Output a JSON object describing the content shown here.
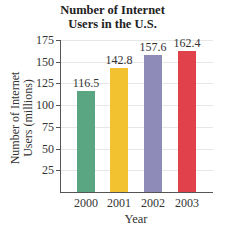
{
  "chart_data": {
    "type": "bar",
    "title": "Number of Internet Users in the U.S.",
    "title_lines": [
      "Number of Internet",
      "Users in the U.S."
    ],
    "categories": [
      "2000",
      "2001",
      "2002",
      "2003"
    ],
    "values": [
      116.5,
      142.8,
      157.6,
      162.4
    ],
    "value_labels": [
      "116.5",
      "142.8",
      "157.6",
      "162.4"
    ],
    "colors": [
      "#5aa683",
      "#f2c230",
      "#8f8bb8",
      "#e0414b"
    ],
    "xlabel": "Year",
    "ylabel": "Number of Internet Users (millions)",
    "ylabel_lines": [
      "Number of Internet",
      "Users (millions)"
    ],
    "yticks": [
      25,
      50,
      75,
      100,
      125,
      150,
      175
    ],
    "ylim": [
      0,
      175
    ],
    "grid": true,
    "legend": null
  }
}
